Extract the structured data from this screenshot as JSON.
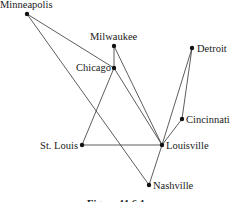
{
  "figure": {
    "caption": "Figure 11.6.1",
    "nodes": [
      {
        "id": "minneapolis",
        "label": "Minneapolis",
        "x": 27,
        "y": 14,
        "lx": 0,
        "ly": 8,
        "anchor": "start"
      },
      {
        "id": "milwaukee",
        "label": "Milwaukee",
        "x": 114,
        "y": 46,
        "lx": 90,
        "ly": 40,
        "anchor": "start"
      },
      {
        "id": "chicago",
        "label": "Chicago",
        "x": 114,
        "y": 68,
        "lx": 111,
        "ly": 71,
        "anchor": "end"
      },
      {
        "id": "detroit",
        "label": "Detroit",
        "x": 192,
        "y": 48,
        "lx": 197,
        "ly": 52,
        "anchor": "start"
      },
      {
        "id": "cincinnati",
        "label": "Cincinnati",
        "x": 182,
        "y": 119,
        "lx": 186,
        "ly": 123,
        "anchor": "start"
      },
      {
        "id": "st-louis",
        "label": "St. Louis",
        "x": 82,
        "y": 145,
        "lx": 78,
        "ly": 149,
        "anchor": "end"
      },
      {
        "id": "louisville",
        "label": "Louisville",
        "x": 162,
        "y": 145,
        "lx": 166,
        "ly": 149,
        "anchor": "start"
      },
      {
        "id": "nashville",
        "label": "Nashville",
        "x": 149,
        "y": 185,
        "lx": 153,
        "ly": 189,
        "anchor": "start"
      }
    ],
    "edges": [
      [
        "minneapolis",
        "chicago"
      ],
      [
        "minneapolis",
        "nashville"
      ],
      [
        "milwaukee",
        "chicago"
      ],
      [
        "milwaukee",
        "louisville"
      ],
      [
        "chicago",
        "louisville"
      ],
      [
        "chicago",
        "st-louis"
      ],
      [
        "st-louis",
        "louisville"
      ],
      [
        "detroit",
        "louisville"
      ],
      [
        "detroit",
        "cincinnati"
      ],
      [
        "cincinnati",
        "louisville"
      ],
      [
        "louisville",
        "nashville"
      ]
    ]
  }
}
